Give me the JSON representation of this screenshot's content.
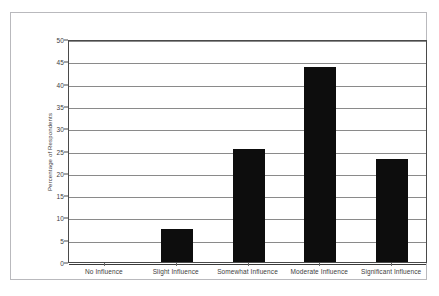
{
  "figure": {
    "title_remnant": "",
    "background_color": "#ffffff",
    "frame_color": "#b9b9bd",
    "bar_color": "#0d0d0d"
  },
  "chart_data": {
    "type": "bar",
    "title": "",
    "xlabel": "",
    "ylabel": "Percentage of Respondents",
    "categories": [
      "No Influence",
      "Slight Influence",
      "Somewhat Influence",
      "Moderate Influence",
      "Significant Influence"
    ],
    "values": [
      0,
      7.5,
      25.4,
      43.8,
      23.2
    ],
    "ylim": [
      0,
      50
    ],
    "ytick_labels": [
      "0",
      "5",
      "10",
      "15",
      "20",
      "25",
      "30",
      "35",
      "40",
      "45",
      "50"
    ],
    "ytick_values": [
      0,
      5,
      10,
      15,
      20,
      25,
      30,
      35,
      40,
      45,
      50
    ],
    "grid": true,
    "grid_axis": "y",
    "legend": false,
    "legend_position": "none",
    "series": [
      {
        "name": "Percentage of Respondents",
        "values": [
          0,
          7.5,
          25.4,
          43.8,
          23.2
        ]
      }
    ]
  }
}
